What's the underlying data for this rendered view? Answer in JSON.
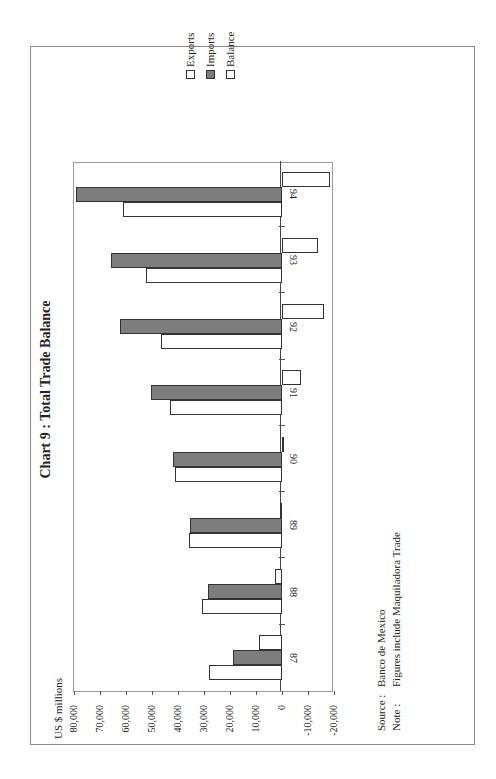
{
  "chart_data": {
    "type": "bar",
    "orientation": "vertical bars, page scanned rotated 90 degrees",
    "title": "Chart 9 : Total Trade Balance",
    "ylabel": "US $ millions",
    "xlabel": "",
    "categories": [
      "87",
      "88",
      "89",
      "90",
      "91",
      "92",
      "93",
      "94"
    ],
    "series": [
      {
        "name": "Exports",
        "values": [
          27900,
          30700,
          35700,
          41100,
          43100,
          46600,
          52400,
          61300
        ]
      },
      {
        "name": "Imports",
        "values": [
          18900,
          28400,
          35300,
          41900,
          50500,
          62500,
          65900,
          79300
        ]
      },
      {
        "name": "Balance",
        "values": [
          8900,
          2600,
          600,
          -900,
          -7400,
          -16300,
          -13900,
          -18600
        ]
      }
    ],
    "ylim": [
      -20000,
      80000
    ],
    "yticks": [
      "80,000",
      "70,000",
      "60,000",
      "50,000",
      "40,000",
      "30,000",
      "20,000",
      "10,000",
      "0",
      "-10,000",
      "-20,000"
    ],
    "legend_position": "right (top of rotated page)",
    "grid": false
  },
  "header": {
    "title": "Chart 9 : Total Trade Balance",
    "unit": "US $ millions"
  },
  "legend": [
    {
      "label": "Exports",
      "color": "#ffffff"
    },
    {
      "label": "Imports",
      "color": "#7d7d7d"
    },
    {
      "label": "Balance",
      "color": "#ffffff"
    }
  ],
  "footer": {
    "source_key": "Source :",
    "source_value": "Banco de Mexico",
    "note_key": "Note :",
    "note_value": "Figures include Maquiladora Trade"
  }
}
